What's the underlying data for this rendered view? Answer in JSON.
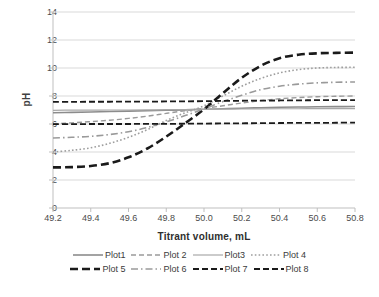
{
  "chart_data": {
    "type": "line",
    "title": "",
    "xlabel": "Titrant volume, mL",
    "ylabel": "pH",
    "xlim": [
      49.2,
      50.8
    ],
    "ylim": [
      0,
      14
    ],
    "xticks": [
      "49.2",
      "49.4",
      "49.6",
      "49.8",
      "50.0",
      "50.2",
      "50.4",
      "50.6",
      "50.8"
    ],
    "xtick_values": [
      49.2,
      49.4,
      49.6,
      49.8,
      50.0,
      50.2,
      50.4,
      50.6,
      50.8
    ],
    "yticks": [
      "0",
      "2",
      "4",
      "6",
      "8",
      "10",
      "12",
      "14"
    ],
    "ytick_values": [
      0,
      2,
      4,
      6,
      8,
      10,
      12,
      14
    ],
    "grid": "horizontal",
    "legend_position": "bottom",
    "x": [
      49.2,
      49.3,
      49.4,
      49.5,
      49.6,
      49.7,
      49.8,
      49.9,
      50.0,
      50.1,
      50.2,
      50.3,
      50.4,
      50.5,
      50.6,
      50.7,
      50.8
    ],
    "series": [
      {
        "name": "Plot1",
        "style": "solid",
        "color": "#8c8c8c",
        "width": 1.6,
        "values": [
          6.8,
          6.83,
          6.86,
          6.89,
          6.92,
          6.95,
          6.98,
          7.01,
          7.05,
          7.09,
          7.13,
          7.16,
          7.19,
          7.21,
          7.23,
          7.24,
          7.25
        ]
      },
      {
        "name": "Plot 2",
        "style": "dashed",
        "color": "#9a9a9a",
        "width": 1.4,
        "values": [
          6.0,
          6.08,
          6.17,
          6.27,
          6.4,
          6.56,
          6.76,
          6.95,
          7.12,
          7.3,
          7.5,
          7.67,
          7.8,
          7.89,
          7.95,
          7.98,
          8.0
        ]
      },
      {
        "name": "Plot3",
        "style": "solid",
        "color": "#a8a8a8",
        "width": 1.2,
        "values": [
          6.98,
          6.99,
          6.99,
          7.0,
          7.0,
          7.01,
          7.02,
          7.03,
          7.05,
          7.06,
          7.07,
          7.08,
          7.09,
          7.09,
          7.1,
          7.1,
          7.1
        ]
      },
      {
        "name": "Plot 4",
        "style": "dotted",
        "color": "#9e9e9e",
        "width": 1.6,
        "values": [
          4.0,
          4.12,
          4.3,
          4.62,
          5.05,
          5.6,
          6.25,
          6.8,
          7.3,
          8.0,
          8.7,
          9.25,
          9.65,
          9.88,
          10.0,
          10.04,
          10.05
        ]
      },
      {
        "name": "Plot 5",
        "style": "dashed-heavy",
        "color": "#1a1a1a",
        "width": 2.6,
        "values": [
          2.9,
          2.92,
          3.0,
          3.2,
          3.62,
          4.25,
          5.1,
          6.05,
          7.05,
          8.2,
          9.3,
          10.15,
          10.7,
          10.95,
          11.05,
          11.08,
          11.1
        ]
      },
      {
        "name": "Plot 6",
        "style": "dashdot",
        "color": "#9a9a9a",
        "width": 1.6,
        "values": [
          5.0,
          5.05,
          5.12,
          5.25,
          5.45,
          5.75,
          6.15,
          6.6,
          7.08,
          7.6,
          8.05,
          8.45,
          8.7,
          8.85,
          8.94,
          8.98,
          9.0
        ]
      },
      {
        "name": "Plot 7",
        "style": "dashed-black",
        "color": "#1a1a1a",
        "width": 1.8,
        "values": [
          7.58,
          7.58,
          7.59,
          7.59,
          7.6,
          7.6,
          7.61,
          7.62,
          7.63,
          7.65,
          7.66,
          7.67,
          7.68,
          7.69,
          7.7,
          7.7,
          7.7
        ]
      },
      {
        "name": "Plot 8",
        "style": "dashed-black",
        "color": "#1a1a1a",
        "width": 1.8,
        "values": [
          5.99,
          5.99,
          6.0,
          6.0,
          6.0,
          6.01,
          6.01,
          6.02,
          6.03,
          6.04,
          6.05,
          6.06,
          6.07,
          6.08,
          6.08,
          6.09,
          6.1
        ]
      }
    ]
  },
  "legend": {
    "rows": [
      [
        {
          "label": "Plot1",
          "key": "solid-gray"
        },
        {
          "label": "Plot 2",
          "key": "dashed-gray"
        },
        {
          "label": "Plot3",
          "key": "solid-gray-thin"
        },
        {
          "label": "Plot 4",
          "key": "dotted-gray"
        }
      ],
      [
        {
          "label": "Plot 5",
          "key": "dashed-heavy-black"
        },
        {
          "label": "Plot 6",
          "key": "dashdot-gray"
        },
        {
          "label": "Plot 7",
          "key": "dashed-black"
        },
        {
          "label": "Plot 8",
          "key": "dashed-black"
        }
      ]
    ]
  },
  "colors": {
    "gridline": "#d9d9d9",
    "axis": "#bfbfbf",
    "text": "#404040",
    "series_black": "#1a1a1a",
    "series_gray": "#9a9a9a"
  }
}
